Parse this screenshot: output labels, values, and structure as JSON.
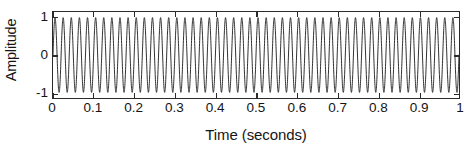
{
  "chart_data": {
    "type": "line",
    "title": "",
    "subtitle": "",
    "xlabel": "Time (seconds)",
    "ylabel": "Amplitude",
    "xlim": [
      0,
      1
    ],
    "ylim": [
      -1.15,
      1.15
    ],
    "xticks": [
      0,
      0.1,
      0.2,
      0.3,
      0.4,
      0.5,
      0.6,
      0.7,
      0.8,
      0.9,
      1
    ],
    "xticklabels": [
      "0",
      "0.1",
      "0.2",
      "0.3",
      "0.4",
      "0.5",
      "0.6",
      "0.7",
      "0.8",
      "0.9",
      "1"
    ],
    "yticks": [
      -1,
      0,
      1
    ],
    "yticklabels": [
      "-1",
      "0",
      "1"
    ],
    "grid": false,
    "legend": null,
    "box": true,
    "series": [
      {
        "name": "sinusoid",
        "color": "#1a1a1a",
        "linewidth": 0.9,
        "description": "Continuous sinusoid of unit amplitude, frequency 50 Hz, over 1 second of time",
        "frequency_hz": 50,
        "amplitude": 1,
        "phase_rad": 0,
        "n_samples": 4000,
        "sample_rate_hz": 4000
      }
    ]
  },
  "axes": {
    "ylabel_text": "Amplitude",
    "xlabel_text": "Time (seconds)"
  },
  "style": {
    "background": "#ffffff",
    "axis_color": "#2b2b2b",
    "text_color": "#151515",
    "line_color": "#1a1a1a"
  }
}
